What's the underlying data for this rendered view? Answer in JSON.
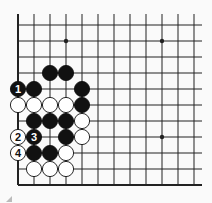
{
  "diagram": {
    "type": "go-board-fragment",
    "grid": {
      "origin_x": 18,
      "origin_y": 25,
      "spacing": 16,
      "cols": 12,
      "rows": 11,
      "top_open": true,
      "right_open": true,
      "left_edge": true,
      "bottom_edge": true
    },
    "hoshi": [
      {
        "col": 3,
        "row": 1
      },
      {
        "col": 9,
        "row": 1
      },
      {
        "col": 9,
        "row": 7
      }
    ],
    "stones": [
      {
        "col": 2,
        "row": 3,
        "color": "black",
        "label": ""
      },
      {
        "col": 3,
        "row": 3,
        "color": "black",
        "label": ""
      },
      {
        "col": 0,
        "row": 4,
        "color": "black",
        "label": "1"
      },
      {
        "col": 1,
        "row": 4,
        "color": "black",
        "label": ""
      },
      {
        "col": 4,
        "row": 4,
        "color": "black",
        "label": ""
      },
      {
        "col": 0,
        "row": 5,
        "color": "white",
        "label": ""
      },
      {
        "col": 1,
        "row": 5,
        "color": "white",
        "label": ""
      },
      {
        "col": 2,
        "row": 5,
        "color": "white",
        "label": ""
      },
      {
        "col": 3,
        "row": 5,
        "color": "white",
        "label": ""
      },
      {
        "col": 4,
        "row": 5,
        "color": "black",
        "label": ""
      },
      {
        "col": 1,
        "row": 6,
        "color": "black",
        "label": ""
      },
      {
        "col": 2,
        "row": 6,
        "color": "black",
        "label": ""
      },
      {
        "col": 3,
        "row": 6,
        "color": "black",
        "label": ""
      },
      {
        "col": 4,
        "row": 6,
        "color": "white",
        "label": ""
      },
      {
        "col": 0,
        "row": 7,
        "color": "white",
        "label": "2"
      },
      {
        "col": 1,
        "row": 7,
        "color": "black",
        "label": "3"
      },
      {
        "col": 3,
        "row": 7,
        "color": "black",
        "label": ""
      },
      {
        "col": 4,
        "row": 7,
        "color": "white",
        "label": ""
      },
      {
        "col": 0,
        "row": 8,
        "color": "white",
        "label": "4"
      },
      {
        "col": 1,
        "row": 8,
        "color": "black",
        "label": ""
      },
      {
        "col": 2,
        "row": 8,
        "color": "black",
        "label": ""
      },
      {
        "col": 3,
        "row": 8,
        "color": "white",
        "label": ""
      },
      {
        "col": 1,
        "row": 9,
        "color": "white",
        "label": ""
      },
      {
        "col": 2,
        "row": 9,
        "color": "white",
        "label": ""
      },
      {
        "col": 3,
        "row": 9,
        "color": "white",
        "label": ""
      }
    ],
    "colors": {
      "line": "#222222",
      "black_stone": "#111111",
      "white_stone": "#ffffff",
      "background": "#fafafa"
    }
  }
}
